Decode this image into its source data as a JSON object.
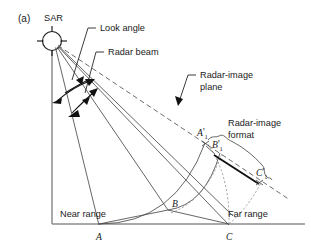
{
  "figure": {
    "panel_label": "(a)",
    "caption_title": "SAR radar-image geometry: layover of a terrain feature onto the radar-image plane"
  },
  "labels": {
    "sar": "SAR",
    "look_angle": "Look angle",
    "radar_beam": "Radar beam",
    "radar_image_plane_line1": "Radar-image",
    "radar_image_plane_line2": "plane",
    "radar_image_format_line1": "Radar-image",
    "radar_image_format_line2": "format",
    "near_range": "Near range",
    "far_range": "Far range"
  },
  "points": [
    {
      "id": "A",
      "base": "A",
      "prime": "",
      "subscript": "",
      "x": 99,
      "y": 228
    },
    {
      "id": "B",
      "base": "B",
      "prime": "",
      "subscript": "",
      "x": 168,
      "y": 212
    },
    {
      "id": "C",
      "base": "C",
      "prime": "",
      "subscript": "",
      "x": 229,
      "y": 228
    },
    {
      "id": "A1",
      "base": "A",
      "prime": "'",
      "subscript": "1",
      "x": 205,
      "y": 140
    },
    {
      "id": "B1",
      "base": "B",
      "prime": "'",
      "subscript": "1",
      "x": 220,
      "y": 150
    },
    {
      "id": "C1",
      "base": "C",
      "prime": "'",
      "subscript": "1",
      "x": 262,
      "y": 178
    }
  ],
  "colors": {
    "line": "#4a4a4a",
    "line_dark": "#111111",
    "axis": "#8c8c8c",
    "dashed": "#5a5a5a",
    "dotted": "#8d8d8d",
    "text": "#1a1a1a",
    "background": "#ffffff"
  }
}
